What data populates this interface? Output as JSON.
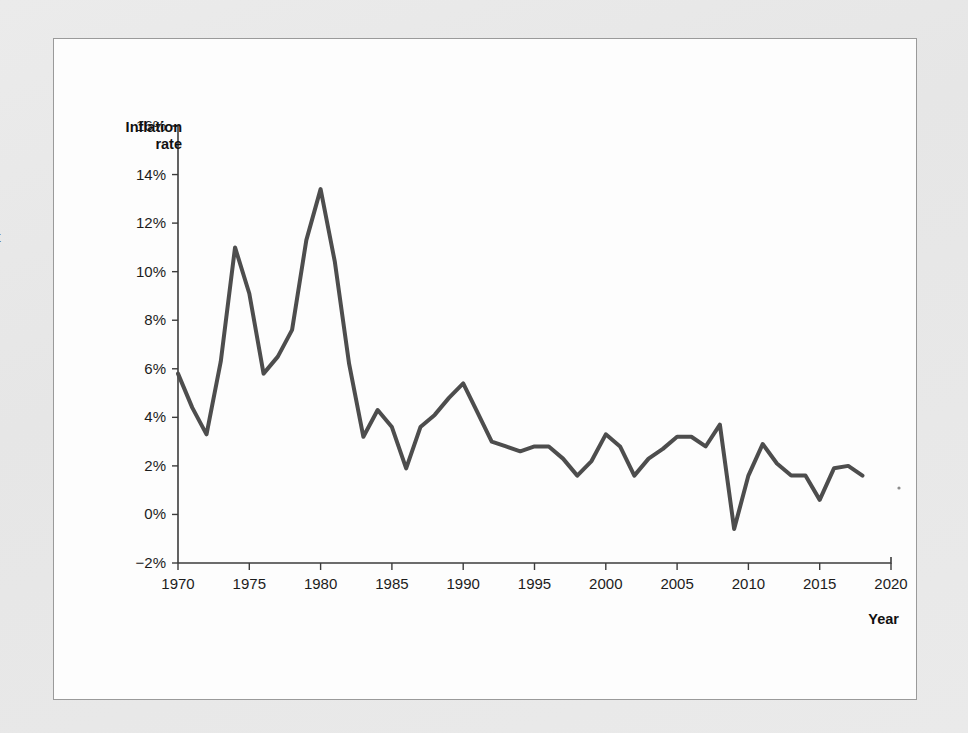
{
  "page": {
    "margin_fragment_text": "t",
    "background_color": "#e9e9e9",
    "frame_border_color": "#9a9a9a",
    "plot_background_color": "#fdfdfd"
  },
  "chart_data": {
    "type": "line",
    "title": "",
    "subtitle": "",
    "xlabel": "Year",
    "ylabel": "Inflation rate",
    "ylabel_line1": "Inflation",
    "ylabel_line2": "rate",
    "xlim": [
      1970,
      2020
    ],
    "ylim": [
      -2,
      16
    ],
    "grid": false,
    "legend": "none",
    "line_color": "#4d4d4d",
    "line_width": 4,
    "xticks": [
      1970,
      1975,
      1980,
      1985,
      1990,
      1995,
      2000,
      2005,
      2010,
      2015,
      2020
    ],
    "xtick_labels": [
      "1970",
      "1975",
      "1980",
      "1985",
      "1990",
      "1995",
      "2000",
      "2005",
      "2010",
      "2015",
      "2020"
    ],
    "yticks": [
      -2,
      0,
      2,
      4,
      6,
      8,
      10,
      12,
      14,
      16
    ],
    "ytick_labels": [
      "−2%",
      "0%",
      "2%",
      "4%",
      "6%",
      "8%",
      "10%",
      "12%",
      "14%",
      "16%"
    ],
    "x": [
      1970,
      1971,
      1972,
      1973,
      1974,
      1975,
      1976,
      1977,
      1978,
      1979,
      1980,
      1981,
      1982,
      1983,
      1984,
      1985,
      1986,
      1987,
      1988,
      1989,
      1990,
      1991,
      1992,
      1993,
      1994,
      1995,
      1996,
      1997,
      1998,
      1999,
      2000,
      2001,
      2002,
      2003,
      2004,
      2005,
      2006,
      2007,
      2008,
      2009,
      2010,
      2011,
      2012,
      2013,
      2014,
      2015,
      2016,
      2017,
      2018
    ],
    "values": [
      5.8,
      4.4,
      3.3,
      6.3,
      11.0,
      9.1,
      5.8,
      6.5,
      7.6,
      11.3,
      13.4,
      10.4,
      6.2,
      3.2,
      4.3,
      3.6,
      1.9,
      3.6,
      4.1,
      4.8,
      5.4,
      4.2,
      3.0,
      2.8,
      2.6,
      2.8,
      2.8,
      2.3,
      1.6,
      2.2,
      3.3,
      2.8,
      1.6,
      2.3,
      2.7,
      3.2,
      3.2,
      2.8,
      3.7,
      -0.6,
      1.6,
      2.9,
      2.1,
      1.6,
      1.6,
      0.6,
      1.9,
      2.0,
      1.6
    ],
    "series": [
      {
        "name": "Inflation rate",
        "values": [
          5.8,
          4.4,
          3.3,
          6.3,
          11.0,
          9.1,
          5.8,
          6.5,
          7.6,
          11.3,
          13.4,
          10.4,
          6.2,
          3.2,
          4.3,
          3.6,
          1.9,
          3.6,
          4.1,
          4.8,
          5.4,
          4.2,
          3.0,
          2.8,
          2.6,
          2.8,
          2.8,
          2.3,
          1.6,
          2.2,
          3.3,
          2.8,
          1.6,
          2.3,
          2.7,
          3.2,
          3.2,
          2.8,
          3.7,
          -0.6,
          1.6,
          2.9,
          2.1,
          1.6,
          1.6,
          0.6,
          1.9,
          2.0,
          1.6
        ]
      }
    ]
  }
}
